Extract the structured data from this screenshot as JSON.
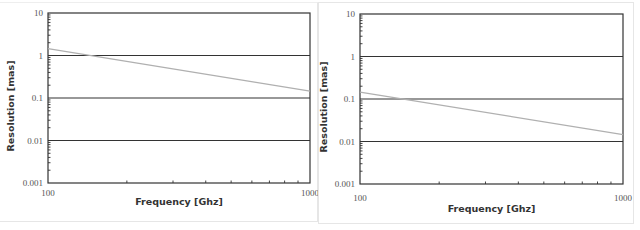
{
  "charts": [
    {
      "title": "",
      "xlabel": "Frequency [Ghz]",
      "ylabel": "Resolution [mas]",
      "x_ticks": [
        "100",
        "1000"
      ],
      "y_ticks": [
        "10",
        "1",
        "0.1",
        "0.01",
        "0.001"
      ]
    },
    {
      "title": "",
      "xlabel": "Frequency [Ghz]",
      "ylabel": "Resolution [mas]",
      "x_ticks": [
        "100",
        "1000"
      ],
      "y_ticks": [
        "10",
        "1",
        "0.1",
        "0.01",
        "0.001"
      ]
    }
  ],
  "colors": {
    "gridline": "#333333",
    "frame": "#333333",
    "series_line": "#b0b0b0"
  },
  "chart_data": [
    {
      "type": "line",
      "title": "",
      "xlabel": "Frequency [Ghz]",
      "ylabel": "Resolution [mas]",
      "xscale": "log",
      "yscale": "log",
      "xlim": [
        100,
        1000
      ],
      "ylim": [
        0.001,
        10
      ],
      "grid": "horizontal major",
      "legend": "none",
      "series": [
        {
          "name": "Resolution",
          "x": [
            100,
            1000
          ],
          "values": [
            1.45,
            0.145
          ]
        }
      ]
    },
    {
      "type": "line",
      "title": "",
      "xlabel": "Frequency [Ghz]",
      "ylabel": "Resolution [mas]",
      "xscale": "log",
      "yscale": "log",
      "xlim": [
        100,
        1000
      ],
      "ylim": [
        0.001,
        10
      ],
      "grid": "horizontal major",
      "legend": "none",
      "series": [
        {
          "name": "Resolution",
          "x": [
            100,
            1000
          ],
          "values": [
            0.145,
            0.0145
          ]
        }
      ]
    }
  ]
}
